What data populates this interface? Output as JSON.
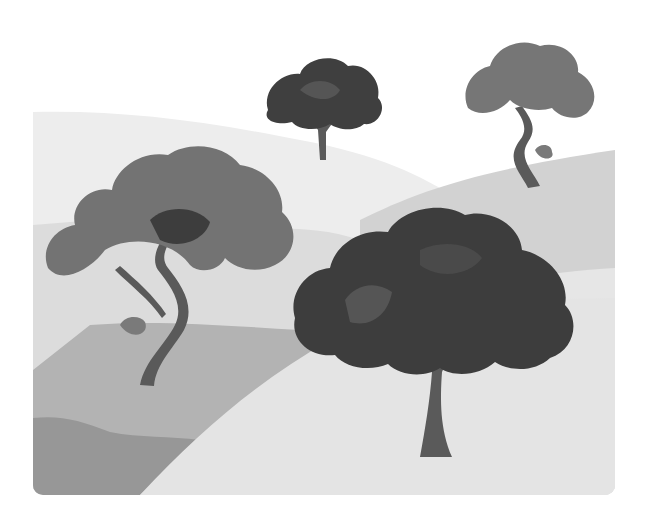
{
  "image": {
    "description": "Grayscale illustration of four stylized trees on layered rolling hills",
    "style": "flat vector, grayscale",
    "trees": [
      {
        "id": "bushy-tree-back-center",
        "type": "round-canopy",
        "tone": "dark"
      },
      {
        "id": "windswept-tree-back-right",
        "type": "curved-trunk",
        "tone": "medium"
      },
      {
        "id": "windswept-tree-left",
        "type": "curved-trunk",
        "tone": "medium"
      },
      {
        "id": "bushy-tree-front-right",
        "type": "round-canopy",
        "tone": "dark"
      }
    ],
    "colors": {
      "background": "#ffffff",
      "sky_hill": "#ededed",
      "hill_light": "#e2e2e2",
      "hill_mid": "#c9c9c9",
      "hill_dark": "#a6a6a6",
      "hill_darker": "#8e8e8e",
      "foreground": "#e6e6e6",
      "canopy_dark": "#3f3f3f",
      "canopy_mid": "#6e6e6e",
      "trunk": "#5a5a5a"
    }
  }
}
